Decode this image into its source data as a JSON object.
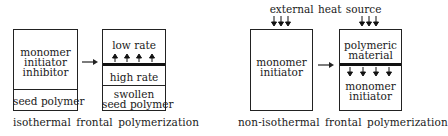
{
  "isothermal": {
    "before": {
      "top_lines": [
        "monomer",
        "initiator",
        "inhibitor"
      ],
      "bottom_label": "seed polymer"
    },
    "after": {
      "top_label": "low rate",
      "middle_label": "high rate",
      "bottom_lines": [
        "swollen",
        "seed polymer"
      ],
      "front_direction": "up"
    },
    "caption": "isothermal frontal polymerization"
  },
  "non_isothermal": {
    "heat_source_label": "external heat source",
    "before": {
      "lines": [
        "monomer",
        "initiator"
      ]
    },
    "after": {
      "top_lines": [
        "polymeric",
        "material"
      ],
      "bottom_lines": [
        "monomer",
        "initiator"
      ],
      "front_direction": "down"
    },
    "caption": "non-isothermal frontal polymerization"
  },
  "icons": {
    "transition_arrow": "right-arrow",
    "front_arrow_up": "up-arrow",
    "front_arrow_down": "down-arrow",
    "heat_arrow": "down-arrow"
  }
}
